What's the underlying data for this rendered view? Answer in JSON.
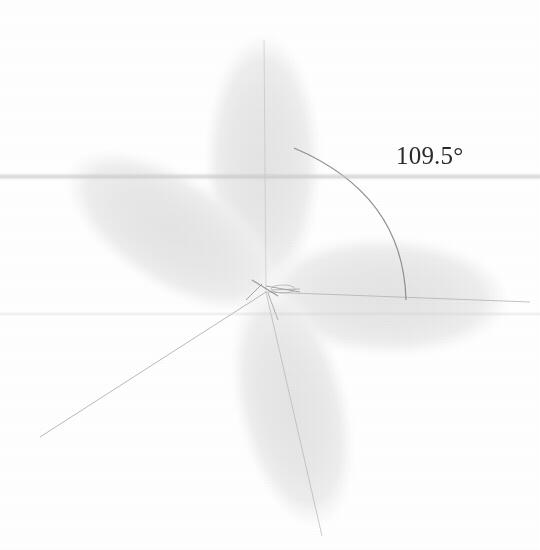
{
  "figure": {
    "background_color": "#ffffff",
    "lobe_fill_color": "#e9e9e9",
    "lobe_edge_color": "#dcdcdc",
    "axis_line_color": "#9a9a9a",
    "arc_color": "#8a8a8a",
    "label_color": "#2a2a2a"
  },
  "annotation": {
    "angle_label": "109.5°",
    "angle_value": 109.5,
    "angle_unit": "degrees"
  },
  "geometry": {
    "center": {
      "x": 266,
      "y": 292
    },
    "lobes": [
      {
        "name": "lobe-top",
        "direction_deg": 90,
        "length": 254,
        "width": 112,
        "tip": {
          "x": 263,
          "y": 38
        }
      },
      {
        "name": "lobe-right",
        "direction_deg": 2,
        "length": 240,
        "width": 112,
        "tip": {
          "x": 506,
          "y": 300
        }
      },
      {
        "name": "lobe-lower-left",
        "direction_deg": 213,
        "length": 256,
        "width": 112,
        "tip": {
          "x": 44,
          "y": 430
        }
      },
      {
        "name": "lobe-bottom",
        "direction_deg": 279,
        "length": 240,
        "width": 108,
        "tip": {
          "x": 320,
          "y": 530
        }
      }
    ],
    "arc": {
      "start": {
        "x": 294,
        "y": 148
      },
      "end": {
        "x": 406,
        "y": 300
      },
      "spans_lobes": [
        "lobe-top",
        "lobe-right"
      ]
    }
  }
}
